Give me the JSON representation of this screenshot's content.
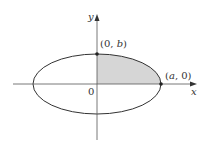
{
  "diagram": {
    "type": "ellipse-quadrant",
    "axes": {
      "x_label": "x",
      "y_label": "y",
      "origin_label": "0"
    },
    "points": [
      {
        "name": "top-vertex",
        "label_prefix": "(0, ",
        "label_var": "b",
        "label_suffix": ")"
      },
      {
        "name": "right-vertex",
        "label_prefix": "(",
        "label_var": "a",
        "label_suffix": ", 0)"
      }
    ],
    "shaded_region": "first quadrant of ellipse",
    "colors": {
      "stroke": "#333333",
      "shade": "#d6d6d6",
      "background": "#ffffff"
    }
  }
}
